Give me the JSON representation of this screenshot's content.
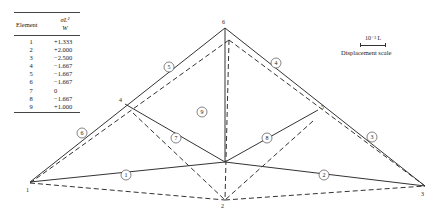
{
  "table": {
    "col_element": "Element",
    "col_value_num": "σL²",
    "col_value_den": "W",
    "rows": [
      {
        "element": "1",
        "value": "+1.333"
      },
      {
        "element": "2",
        "value": "+2.000"
      },
      {
        "element": "3",
        "value": "−2.500"
      },
      {
        "element": "4",
        "value": "−1.667"
      },
      {
        "element": "5",
        "value": "−1.667"
      },
      {
        "element": "6",
        "value": "−1.667"
      },
      {
        "element": "7",
        "value": "0"
      },
      {
        "element": "8",
        "value": "−1.667"
      },
      {
        "element": "9",
        "value": "+1.000"
      }
    ]
  },
  "scale": {
    "value": "10⁻³ L",
    "caption": "Displacement scale"
  },
  "nodes": {
    "n1": "1",
    "n2": "2",
    "n3": "3",
    "n4": "4",
    "n5": "5",
    "n6": "6"
  },
  "members": {
    "m1": "1",
    "m2": "2",
    "m3": "3",
    "m4": "4",
    "m5": "5",
    "m6": "6",
    "m7": "7",
    "m8": "8",
    "m9": "9"
  },
  "colors": {
    "line": "#333333",
    "text": "#222222"
  }
}
